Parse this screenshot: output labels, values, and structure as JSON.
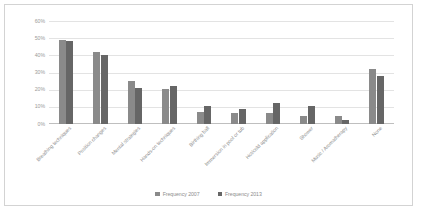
{
  "chart_data": {
    "type": "bar",
    "title": "",
    "xlabel": "",
    "ylabel": "",
    "ylim": [
      0,
      60
    ],
    "yticks": [
      "0%",
      "10%",
      "20%",
      "30%",
      "40%",
      "50%",
      "60%"
    ],
    "ytick_values": [
      0,
      10,
      20,
      30,
      40,
      50,
      60
    ],
    "grid": true,
    "legend_position": "bottom",
    "categories": [
      "Breathing techniques",
      "Position changes",
      "Mental strategies",
      "Hands-on techniques",
      "Birthing ball",
      "Immersion in pool or tub",
      "Hot/cold application",
      "Shower",
      "Music / Aromatherapy",
      "None"
    ],
    "series": [
      {
        "name": "Frequency 2007",
        "color": "#8a8a8a",
        "values": [
          49,
          42,
          25,
          20.5,
          7,
          6.5,
          6.5,
          4.5,
          4.5,
          32
        ]
      },
      {
        "name": "Frequency 2013",
        "color": "#666666",
        "values": [
          48.5,
          40,
          21,
          22,
          10.5,
          8.5,
          12.5,
          10.5,
          2.5,
          28
        ]
      }
    ]
  },
  "legend": {
    "items": [
      {
        "label": "Frequency 2007",
        "color": "#8a8a8a"
      },
      {
        "label": "Frequency 2013",
        "color": "#666666"
      }
    ]
  }
}
